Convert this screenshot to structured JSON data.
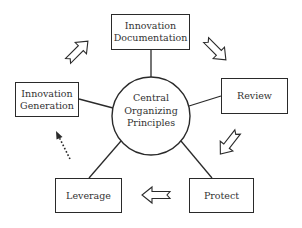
{
  "diagram": {
    "title": "",
    "center": {
      "lines": [
        "Central",
        "Organizing",
        "Principles"
      ]
    },
    "nodes": [
      {
        "id": "innovation-documentation",
        "lines": [
          "Innovation",
          "Documentation"
        ]
      },
      {
        "id": "review",
        "lines": [
          "Review"
        ]
      },
      {
        "id": "protect",
        "lines": [
          "Protect"
        ]
      },
      {
        "id": "leverage",
        "lines": [
          "Leverage"
        ]
      },
      {
        "id": "innovation-generation",
        "lines": [
          "Innovation",
          "Generation"
        ]
      }
    ],
    "flow": [
      {
        "from": "innovation-generation",
        "to": "innovation-documentation",
        "style": "hollow-arrow"
      },
      {
        "from": "innovation-documentation",
        "to": "review",
        "style": "hollow-arrow"
      },
      {
        "from": "review",
        "to": "protect",
        "style": "hollow-arrow"
      },
      {
        "from": "protect",
        "to": "leverage",
        "style": "hollow-arrow"
      },
      {
        "from": "leverage",
        "to": "innovation-generation",
        "style": "dotted-arrow"
      }
    ],
    "colors": {
      "stroke": "#2a2a2a",
      "text": "#333333",
      "background": "#ffffff"
    }
  }
}
